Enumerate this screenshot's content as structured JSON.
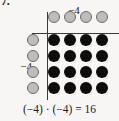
{
  "figure": {
    "problem_number": "7.",
    "equation": "(−4) · (−4) = 16",
    "top_axis_label": "−4",
    "left_axis_label": "−4",
    "colors": {
      "background": "#f7f6f4",
      "axis": "#3a3a3a",
      "open_dot_fill": "#bfbdba",
      "open_dot_stroke": "#6e6c69",
      "filled_dot": "#0d0d0d",
      "text": "#1a1a1a"
    }
  },
  "chart_data": {
    "type": "scatter",
    "title": "",
    "subtitle": "",
    "xlabel": "−4",
    "ylabel": "−4",
    "grid": false,
    "legend": "none",
    "annotations": [
      "(−4) · (−4) = 16"
    ],
    "series": [
      {
        "name": "column-header-dots",
        "style": "open",
        "count": 4,
        "label": "−4",
        "points": [
          {
            "x": 1,
            "y": 0
          },
          {
            "x": 2,
            "y": 0
          },
          {
            "x": 3,
            "y": 0
          },
          {
            "x": 4,
            "y": 0
          }
        ]
      },
      {
        "name": "row-header-dots",
        "style": "open",
        "count": 4,
        "label": "−4",
        "points": [
          {
            "x": 0,
            "y": 1
          },
          {
            "x": 0,
            "y": 2
          },
          {
            "x": 0,
            "y": 3
          },
          {
            "x": 0,
            "y": 4
          }
        ]
      },
      {
        "name": "product-dots",
        "style": "filled",
        "count": 16,
        "rows": 4,
        "columns": 4,
        "points": [
          {
            "x": 1,
            "y": 1
          },
          {
            "x": 2,
            "y": 1
          },
          {
            "x": 3,
            "y": 1
          },
          {
            "x": 4,
            "y": 1
          },
          {
            "x": 1,
            "y": 2
          },
          {
            "x": 2,
            "y": 2
          },
          {
            "x": 3,
            "y": 2
          },
          {
            "x": 4,
            "y": 2
          },
          {
            "x": 1,
            "y": 3
          },
          {
            "x": 2,
            "y": 3
          },
          {
            "x": 3,
            "y": 3
          },
          {
            "x": 4,
            "y": 3
          },
          {
            "x": 1,
            "y": 4
          },
          {
            "x": 2,
            "y": 4
          },
          {
            "x": 3,
            "y": 4
          },
          {
            "x": 4,
            "y": 4
          }
        ]
      }
    ],
    "geometry": {
      "origin_px": {
        "x": 47,
        "y": 33
      },
      "column_x_px": [
        54,
        70,
        86,
        102
      ],
      "row_y_px": [
        40,
        56,
        72,
        88
      ],
      "header_row_y_px": 17,
      "header_column_x_px": 33,
      "dot_diameter_px": 12
    }
  }
}
